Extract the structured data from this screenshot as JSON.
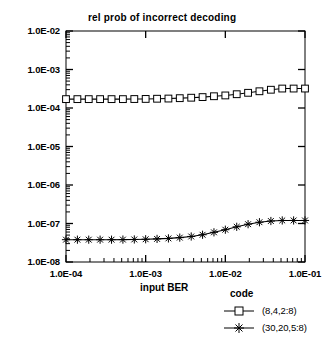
{
  "chart_data": {
    "type": "line",
    "title": "rel prob of incorrect decoding",
    "xlabel": "input BER",
    "ylabel": "",
    "xscale": "log",
    "yscale": "log",
    "xlim": [
      0.0001,
      0.1
    ],
    "ylim": [
      1e-08,
      0.01
    ],
    "grid": false,
    "legend_title": "code",
    "legend_position": "below-right",
    "xtick_labels": [
      "1.0E-04",
      "1.0E-03",
      "1.0E-02",
      "1.0E-01"
    ],
    "xtick_values": [
      0.0001,
      0.001,
      0.01,
      0.1
    ],
    "ytick_labels": [
      "1.0E-02",
      "1.0E-03",
      "1.0E-04",
      "1.0E-05",
      "1.0E-06",
      "1.0E-07",
      "1.0E-08"
    ],
    "ytick_values": [
      0.01,
      0.001,
      0.0001,
      1e-05,
      1e-06,
      1e-07,
      1e-08
    ],
    "x": [
      0.0001,
      0.000139,
      0.000193,
      0.000268,
      0.000373,
      0.000518,
      0.00072,
      0.001,
      0.00139,
      0.00193,
      0.00268,
      0.00373,
      0.00518,
      0.0072,
      0.01,
      0.0139,
      0.0193,
      0.0268,
      0.0373,
      0.0518,
      0.072,
      0.1
    ],
    "series": [
      {
        "name": "(8,4,2:8)",
        "marker": "square",
        "color": "#000000",
        "values": [
          0.00017,
          0.00017,
          0.00017,
          0.00017,
          0.00017,
          0.00017,
          0.000171,
          0.000172,
          0.000174,
          0.000176,
          0.00018,
          0.000185,
          0.000192,
          0.000202,
          0.000212,
          0.000228,
          0.000248,
          0.000272,
          0.000298,
          0.00032,
          0.00032,
          0.00032
        ]
      },
      {
        "name": "(30,20,5:8)",
        "marker": "star",
        "color": "#000000",
        "values": [
          3.8e-08,
          3.8e-08,
          3.8e-08,
          3.8e-08,
          3.8e-08,
          3.82e-08,
          3.85e-08,
          3.9e-08,
          3.98e-08,
          4.1e-08,
          4.3e-08,
          4.6e-08,
          5.1e-08,
          5.9e-08,
          6.9e-08,
          8.2e-08,
          9.6e-08,
          1.08e-07,
          1.16e-07,
          1.2e-07,
          1.2e-07,
          1.2e-07
        ]
      }
    ]
  },
  "legend": {
    "title": "code",
    "entries": [
      {
        "label": "(8,4,2:8)"
      },
      {
        "label": "(30,20,5:8)"
      }
    ]
  }
}
